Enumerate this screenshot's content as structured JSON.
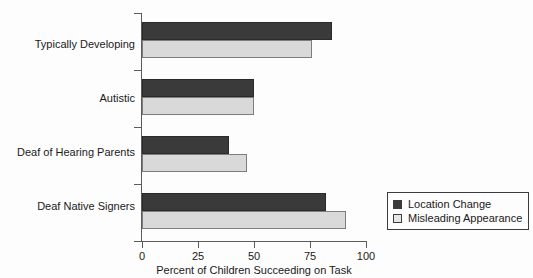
{
  "chart_data": {
    "type": "bar",
    "orientation": "horizontal",
    "title": "",
    "xlabel": "Percent of Children Succeeding on Task",
    "ylabel": "",
    "xlim": [
      0,
      100
    ],
    "xticks": [
      0,
      25,
      50,
      75,
      100
    ],
    "xtick_labels": [
      "0",
      "25",
      "50",
      "75",
      "100"
    ],
    "grid": false,
    "legend_position": "right-bottom-inside",
    "categories": [
      "Typically Developing",
      "Autistic",
      "Deaf of Hearing Parents",
      "Deaf Native Signers"
    ],
    "series": [
      {
        "name": "Location Change",
        "color": "#3a3a3a",
        "values": [
          85,
          50,
          39,
          82
        ]
      },
      {
        "name": "Misleading Appearance",
        "color": "#d9d9d9",
        "values": [
          76,
          50,
          47,
          91
        ]
      }
    ]
  },
  "legend": {
    "items": [
      {
        "label": "Location Change",
        "swatch": "dark-square-swatch"
      },
      {
        "label": "Misleading Appearance",
        "swatch": "light-square-swatch"
      }
    ]
  },
  "colors": {
    "background": "#fdfdfd",
    "axis": "#5b5b5b",
    "text": "#1a1a1a",
    "series_location_change": "#3a3a3a",
    "series_misleading_appearance": "#d9d9d9"
  }
}
